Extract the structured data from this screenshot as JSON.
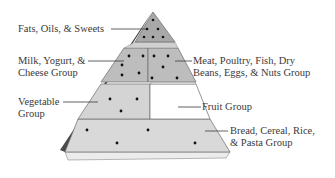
{
  "diagram": {
    "colors": {
      "background": "#ffffff",
      "side_face": "#4a4a4a",
      "top_tier": "#a8a8a8",
      "middle_tier": "#bdbdbd",
      "vegetable_tier": "#d4d4d4",
      "bread_tier": "#d9d9d9",
      "fruit_tier": "#ffffff",
      "edge_highlight": "#ececec",
      "outline": "#6a6a6a",
      "dot": "#111111",
      "label_text": "#3a3a3a",
      "leader_line": "#3a3a3a"
    },
    "labels": {
      "fats": {
        "lines": [
          "Fats, Oils, & Sweets"
        ]
      },
      "milk": {
        "lines": [
          "Milk, Yogurt, &",
          "Cheese Group"
        ]
      },
      "meat": {
        "lines": [
          "Meat, Poultry, Fish, Dry",
          "Beans, Eggs, & Nuts Group"
        ]
      },
      "vegetable": {
        "lines": [
          "Vegetable",
          "Group"
        ]
      },
      "fruit": {
        "lines": [
          "Fruit Group"
        ]
      },
      "bread": {
        "lines": [
          "Bread, Cereal, Rice,",
          "& Pasta Group"
        ]
      }
    },
    "tiers": [
      {
        "id": "fats",
        "name": "Fats, Oils, & Sweets",
        "dots": 6
      },
      {
        "id": "milk",
        "name": "Milk, Yogurt, & Cheese Group",
        "dots": 6
      },
      {
        "id": "meat",
        "name": "Meat, Poultry, Fish, Dry Beans, Eggs, & Nuts Group",
        "dots": 5
      },
      {
        "id": "vegetable",
        "name": "Vegetable Group",
        "dots": 3
      },
      {
        "id": "fruit",
        "name": "Fruit Group",
        "dots": 0
      },
      {
        "id": "bread",
        "name": "Bread, Cereal, Rice, & Pasta Group",
        "dots": 5
      }
    ]
  }
}
